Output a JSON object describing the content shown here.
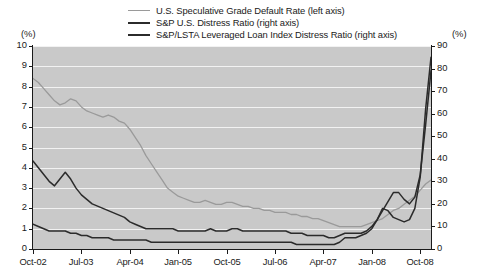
{
  "legend": {
    "items": [
      {
        "label": "U.S. Speculative Grade Default Rate (left axis)",
        "color": "#9a9a9a",
        "width": "1.6px"
      },
      {
        "label": "S&P U.S. Distress Ratio (right axis)",
        "color": "#2b2b2b",
        "width": "2px"
      },
      {
        "label": "S&P/LSTA Leveraged Loan Index Distress Ratio (right axis)",
        "color": "#2b2b2b",
        "width": "2px"
      }
    ]
  },
  "axes": {
    "left_unit": "(%)",
    "right_unit": "(%)",
    "left_ticks": [
      "10",
      "9",
      "8",
      "7",
      "6",
      "5",
      "4",
      "3",
      "2",
      "1",
      "0"
    ],
    "right_ticks": [
      "90",
      "80",
      "70",
      "60",
      "50",
      "40",
      "30",
      "20",
      "10",
      "0"
    ],
    "x_ticks": [
      "Oct-02",
      "Jul-03",
      "Apr-04",
      "Jan-05",
      "Oct-05",
      "Jul-06",
      "Apr-07",
      "Jan-08",
      "Oct-08"
    ]
  },
  "style": {
    "plot_background": "#c9c9c9",
    "gridline_color": "#f2f2f2",
    "axis_color": "#1a1a1a",
    "page_background": "#ffffff"
  },
  "chart_data": {
    "type": "line",
    "title": "",
    "xlabel": "",
    "ylabel": "(%)",
    "grid": true,
    "legend_position": "top-center",
    "x_tick_labels": [
      "Oct-02",
      "Jul-03",
      "Apr-04",
      "Jan-05",
      "Oct-05",
      "Jul-06",
      "Apr-07",
      "Jan-08",
      "Oct-08"
    ],
    "x_range": [
      "Oct-02",
      "Dec-08"
    ],
    "left_axis": {
      "label": "(%)",
      "ylim": [
        0,
        10
      ],
      "tick_step": 1
    },
    "right_axis": {
      "label": "(%)",
      "ylim": [
        0,
        90
      ],
      "tick_step": 10
    },
    "series": [
      {
        "name": "U.S. Speculative Grade Default Rate (left axis)",
        "axis": "left",
        "color": "#9a9a9a",
        "x": [
          "Oct-02",
          "Nov-02",
          "Dec-02",
          "Jan-03",
          "Feb-03",
          "Mar-03",
          "Apr-03",
          "May-03",
          "Jun-03",
          "Jul-03",
          "Aug-03",
          "Sep-03",
          "Oct-03",
          "Nov-03",
          "Dec-03",
          "Jan-04",
          "Feb-04",
          "Mar-04",
          "Apr-04",
          "May-04",
          "Jun-04",
          "Jul-04",
          "Aug-04",
          "Sep-04",
          "Oct-04",
          "Nov-04",
          "Dec-04",
          "Jan-05",
          "Feb-05",
          "Mar-05",
          "Apr-05",
          "May-05",
          "Jun-05",
          "Jul-05",
          "Aug-05",
          "Sep-05",
          "Oct-05",
          "Nov-05",
          "Dec-05",
          "Jan-06",
          "Feb-06",
          "Mar-06",
          "Apr-06",
          "May-06",
          "Jun-06",
          "Jul-06",
          "Aug-06",
          "Sep-06",
          "Oct-06",
          "Nov-06",
          "Dec-06",
          "Jan-07",
          "Feb-07",
          "Mar-07",
          "Apr-07",
          "May-07",
          "Jun-07",
          "Jul-07",
          "Aug-07",
          "Sep-07",
          "Oct-07",
          "Nov-07",
          "Dec-07",
          "Jan-08",
          "Feb-08",
          "Mar-08",
          "Apr-08",
          "May-08",
          "Jun-08",
          "Jul-08",
          "Aug-08",
          "Sep-08",
          "Oct-08",
          "Nov-08",
          "Dec-08"
        ],
        "values": [
          8.4,
          8.2,
          7.9,
          7.6,
          7.3,
          7.1,
          7.2,
          7.4,
          7.3,
          7.0,
          6.8,
          6.7,
          6.6,
          6.5,
          6.6,
          6.5,
          6.3,
          6.2,
          5.9,
          5.5,
          5.1,
          4.6,
          4.2,
          3.8,
          3.4,
          3.0,
          2.8,
          2.6,
          2.5,
          2.4,
          2.3,
          2.3,
          2.4,
          2.3,
          2.2,
          2.2,
          2.3,
          2.3,
          2.2,
          2.1,
          2.1,
          2.0,
          2.0,
          1.9,
          1.9,
          1.8,
          1.8,
          1.8,
          1.7,
          1.7,
          1.6,
          1.6,
          1.5,
          1.5,
          1.4,
          1.3,
          1.2,
          1.1,
          1.1,
          1.1,
          1.1,
          1.1,
          1.2,
          1.3,
          1.4,
          1.5,
          1.7,
          1.9,
          2.0,
          2.2,
          2.4,
          2.6,
          2.9,
          3.2,
          3.4
        ]
      },
      {
        "name": "S&P U.S. Distress Ratio (right axis)",
        "axis": "right",
        "color": "#2b2b2b",
        "x": [
          "Oct-02",
          "Nov-02",
          "Dec-02",
          "Jan-03",
          "Feb-03",
          "Mar-03",
          "Apr-03",
          "May-03",
          "Jun-03",
          "Jul-03",
          "Aug-03",
          "Sep-03",
          "Oct-03",
          "Nov-03",
          "Dec-03",
          "Jan-04",
          "Feb-04",
          "Mar-04",
          "Apr-04",
          "May-04",
          "Jun-04",
          "Jul-04",
          "Aug-04",
          "Sep-04",
          "Oct-04",
          "Nov-04",
          "Dec-04",
          "Jan-05",
          "Feb-05",
          "Mar-05",
          "Apr-05",
          "May-05",
          "Jun-05",
          "Jul-05",
          "Aug-05",
          "Sep-05",
          "Oct-05",
          "Nov-05",
          "Dec-05",
          "Jan-06",
          "Feb-06",
          "Mar-06",
          "Apr-06",
          "May-06",
          "Jun-06",
          "Jul-06",
          "Aug-06",
          "Sep-06",
          "Oct-06",
          "Nov-06",
          "Dec-06",
          "Jan-07",
          "Feb-07",
          "Mar-07",
          "Apr-07",
          "May-07",
          "Jun-07",
          "Jul-07",
          "Aug-07",
          "Sep-07",
          "Oct-07",
          "Nov-07",
          "Dec-07",
          "Jan-08",
          "Feb-08",
          "Mar-08",
          "Apr-08",
          "May-08",
          "Jun-08",
          "Jul-08",
          "Aug-08",
          "Sep-08",
          "Oct-08",
          "Nov-08",
          "Dec-08"
        ],
        "values": [
          39,
          36,
          33,
          30,
          28,
          31,
          34,
          31,
          27,
          24,
          22,
          20,
          19,
          18,
          17,
          16,
          15,
          14,
          12,
          11,
          10,
          9,
          9,
          9,
          9,
          9,
          9,
          8,
          8,
          8,
          8,
          8,
          8,
          9,
          8,
          8,
          8,
          9,
          9,
          8,
          8,
          8,
          8,
          8,
          8,
          8,
          8,
          8,
          7,
          7,
          7,
          6,
          6,
          6,
          6,
          5,
          5,
          6,
          7,
          7,
          7,
          7,
          8,
          10,
          13,
          17,
          21,
          25,
          25,
          22,
          20,
          23,
          33,
          55,
          79
        ]
      },
      {
        "name": "S&P/LSTA Leveraged Loan Index Distress Ratio (right axis)",
        "axis": "right",
        "color": "#2b2b2b",
        "x": [
          "Oct-02",
          "Nov-02",
          "Dec-02",
          "Jan-03",
          "Feb-03",
          "Mar-03",
          "Apr-03",
          "May-03",
          "Jun-03",
          "Jul-03",
          "Aug-03",
          "Sep-03",
          "Oct-03",
          "Nov-03",
          "Dec-03",
          "Jan-04",
          "Feb-04",
          "Mar-04",
          "Apr-04",
          "May-04",
          "Jun-04",
          "Jul-04",
          "Aug-04",
          "Sep-04",
          "Oct-04",
          "Nov-04",
          "Dec-04",
          "Jan-05",
          "Feb-05",
          "Mar-05",
          "Apr-05",
          "May-05",
          "Jun-05",
          "Jul-05",
          "Aug-05",
          "Sep-05",
          "Oct-05",
          "Nov-05",
          "Dec-05",
          "Jan-06",
          "Feb-06",
          "Mar-06",
          "Apr-06",
          "May-06",
          "Jun-06",
          "Jul-06",
          "Aug-06",
          "Sep-06",
          "Oct-06",
          "Nov-06",
          "Dec-06",
          "Jan-07",
          "Feb-07",
          "Mar-07",
          "Apr-07",
          "May-07",
          "Jun-07",
          "Jul-07",
          "Aug-07",
          "Sep-07",
          "Oct-07",
          "Nov-07",
          "Dec-07",
          "Jan-08",
          "Feb-08",
          "Mar-08",
          "Apr-08",
          "May-08",
          "Jun-08",
          "Jul-08",
          "Aug-08",
          "Sep-08",
          "Oct-08",
          "Nov-08",
          "Dec-08"
        ],
        "values": [
          11,
          10,
          9,
          8,
          8,
          8,
          8,
          7,
          7,
          6,
          6,
          5,
          5,
          5,
          5,
          4,
          4,
          4,
          4,
          4,
          4,
          4,
          3,
          3,
          3,
          3,
          3,
          3,
          3,
          3,
          3,
          3,
          3,
          3,
          3,
          3,
          3,
          3,
          3,
          3,
          3,
          3,
          3,
          3,
          3,
          3,
          3,
          3,
          3,
          2,
          2,
          2,
          2,
          2,
          2,
          2,
          2,
          3,
          5,
          5,
          5,
          6,
          7,
          9,
          13,
          18,
          17,
          14,
          13,
          12,
          13,
          18,
          32,
          62,
          85
        ]
      }
    ],
    "annotations": [
      {
        "text": "Peak of distress ratios at end of sample",
        "value": 85,
        "axis": "right"
      }
    ]
  }
}
